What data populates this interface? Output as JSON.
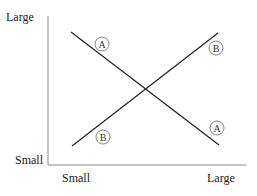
{
  "diagram": {
    "type": "crossing-lines",
    "y_axis": {
      "top_label": "Large",
      "bottom_label": "Small"
    },
    "x_axis": {
      "left_label": "Small",
      "right_label": "Large"
    },
    "lines": [
      {
        "id": "A",
        "direction": "descending",
        "label": "A",
        "from": [
          71,
          32
        ],
        "to": [
          219,
          145
        ],
        "markers": [
          {
            "label": "A",
            "cx": 102,
            "cy": 44
          },
          {
            "label": "A",
            "cx": 217,
            "cy": 128
          }
        ]
      },
      {
        "id": "B",
        "direction": "ascending",
        "label": "B",
        "from": [
          72,
          146
        ],
        "to": [
          218,
          33
        ],
        "markers": [
          {
            "label": "B",
            "cx": 103,
            "cy": 137
          },
          {
            "label": "B",
            "cx": 216,
            "cy": 48
          }
        ]
      }
    ],
    "colors": {
      "line": "#2a2a2a",
      "axis": "#888888",
      "marker_circle": "#777777",
      "text": "#222222"
    }
  }
}
